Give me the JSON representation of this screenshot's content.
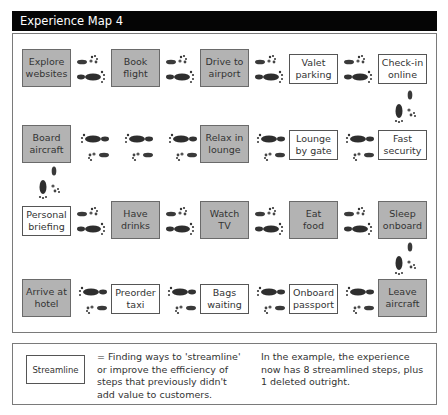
{
  "header": {
    "title": "Experience Map 4"
  },
  "colors": {
    "header_bg": "#050505",
    "streamlined_fill": "#b3b3b3",
    "new_step_fill": "#ffffff",
    "footprint": "#3a3a3a"
  },
  "rows": [
    {
      "direction": "left-to-right",
      "steps": [
        {
          "label": "Explore\nwebsites",
          "type": "streamlined"
        },
        {
          "label": "Book\nflight",
          "type": "streamlined"
        },
        {
          "label": "Drive to\nairport",
          "type": "streamlined"
        },
        {
          "label": "Valet\nparking",
          "type": "new"
        },
        {
          "label": "Check-in\nonline",
          "type": "new"
        }
      ]
    },
    {
      "direction": "right-to-left",
      "steps": [
        {
          "label": "Board\naircraft",
          "type": "streamlined"
        },
        {
          "label": "Relax in\nlounge",
          "type": "streamlined"
        },
        {
          "label": "Lounge\nby gate",
          "type": "new"
        },
        {
          "label": "Fast\nsecurity",
          "type": "new"
        }
      ],
      "note": "three footprint pairs between Board aircraft and Relax in lounge (one step deleted)"
    },
    {
      "direction": "left-to-right",
      "steps": [
        {
          "label": "Personal\nbriefing",
          "type": "new"
        },
        {
          "label": "Have\ndrinks",
          "type": "streamlined"
        },
        {
          "label": "Watch\nTV",
          "type": "streamlined"
        },
        {
          "label": "Eat\nfood",
          "type": "streamlined"
        },
        {
          "label": "Sleep\nonboard",
          "type": "streamlined"
        }
      ]
    },
    {
      "direction": "right-to-left",
      "steps": [
        {
          "label": "Arrive at\nhotel",
          "type": "streamlined"
        },
        {
          "label": "Preorder\ntaxi",
          "type": "new"
        },
        {
          "label": "Bags\nwaiting",
          "type": "new"
        },
        {
          "label": "Onboard\npassport",
          "type": "new"
        },
        {
          "label": "Leave\naircraft",
          "type": "streamlined"
        }
      ]
    }
  ],
  "legend": {
    "box_label": "Streamline",
    "definition": "= Finding ways to 'streamline' or improve the efficiency of steps that previously didn't add value to customers.",
    "note": "In the example, the experience now has 8 streamlined steps, plus 1 deleted outright."
  },
  "icons": {
    "connector": "footprints-icon"
  }
}
